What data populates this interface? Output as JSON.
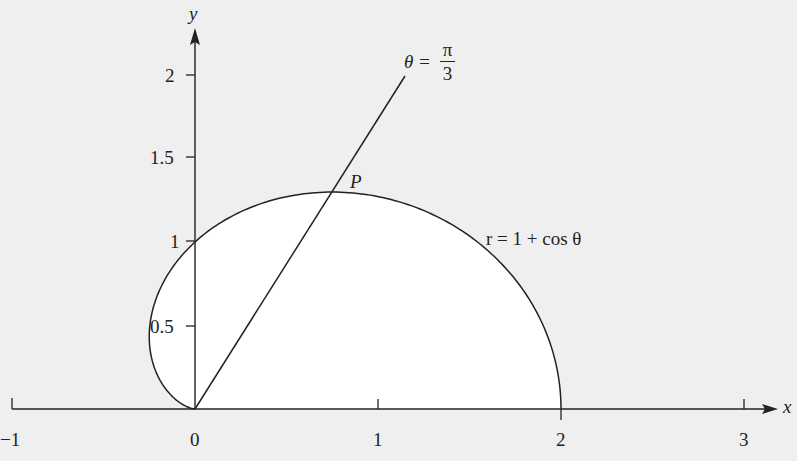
{
  "chart_data": {
    "type": "line",
    "title": "",
    "xlabel": "x",
    "ylabel": "y",
    "xlim": [
      -1,
      3
    ],
    "ylim": [
      0,
      2.2
    ],
    "grid": false,
    "x_ticks": [
      -1,
      0,
      1,
      2,
      3
    ],
    "x_tick_labels": [
      "−1",
      "0",
      "1",
      "2",
      "3"
    ],
    "y_ticks": [
      0.5,
      1,
      1.5,
      2
    ],
    "y_tick_labels": [
      "0.5",
      "1",
      "1.5",
      "2"
    ],
    "series": [
      {
        "name": "r = 1 + cos θ",
        "kind": "polar-curve",
        "equation": "r = 1 + cos θ",
        "theta_range": [
          0,
          3.14159
        ],
        "points": [
          [
            2,
            0
          ],
          [
            1.93,
            0.52
          ],
          [
            1.73,
            1.0
          ],
          [
            1.43,
            1.37
          ],
          [
            1.07,
            1.57
          ],
          [
            0.75,
            1.3
          ],
          [
            0.5,
            1.0
          ],
          [
            0.2,
            0.7
          ],
          [
            0,
            0.5
          ],
          [
            -0.13,
            0.44
          ],
          [
            -0.25,
            0.43
          ],
          [
            -0.3,
            0.3
          ],
          [
            -0.25,
            0.12
          ],
          [
            0,
            0
          ]
        ]
      },
      {
        "name": "θ = π/3",
        "kind": "ray",
        "equation": "θ = π/3",
        "points": [
          [
            0,
            0
          ],
          [
            1.15,
            2.0
          ]
        ]
      }
    ],
    "annotations": [
      {
        "text": "P",
        "point": [
          0.75,
          1.299
        ],
        "description": "intersection of ray θ = π/3 with curve"
      },
      {
        "text": "r = 1 + cos θ",
        "near": [
          1.6,
          1.05
        ]
      },
      {
        "text": "θ = π/3",
        "near": [
          1.1,
          2.1
        ]
      }
    ]
  },
  "labels": {
    "x_axis": "x",
    "y_axis": "y",
    "point_p": "P",
    "curve_label": "r = 1 + cos θ",
    "ray_label_lhs": "θ =",
    "ray_label_num": "π",
    "ray_label_den": "3",
    "xt": [
      "−1",
      "0",
      "1",
      "2",
      "3"
    ],
    "yt": [
      "0.5",
      "1",
      "1.5",
      "2"
    ]
  },
  "colors": {
    "background": "#efefef",
    "ink": "#222222",
    "region_fill": "#ffffff"
  }
}
